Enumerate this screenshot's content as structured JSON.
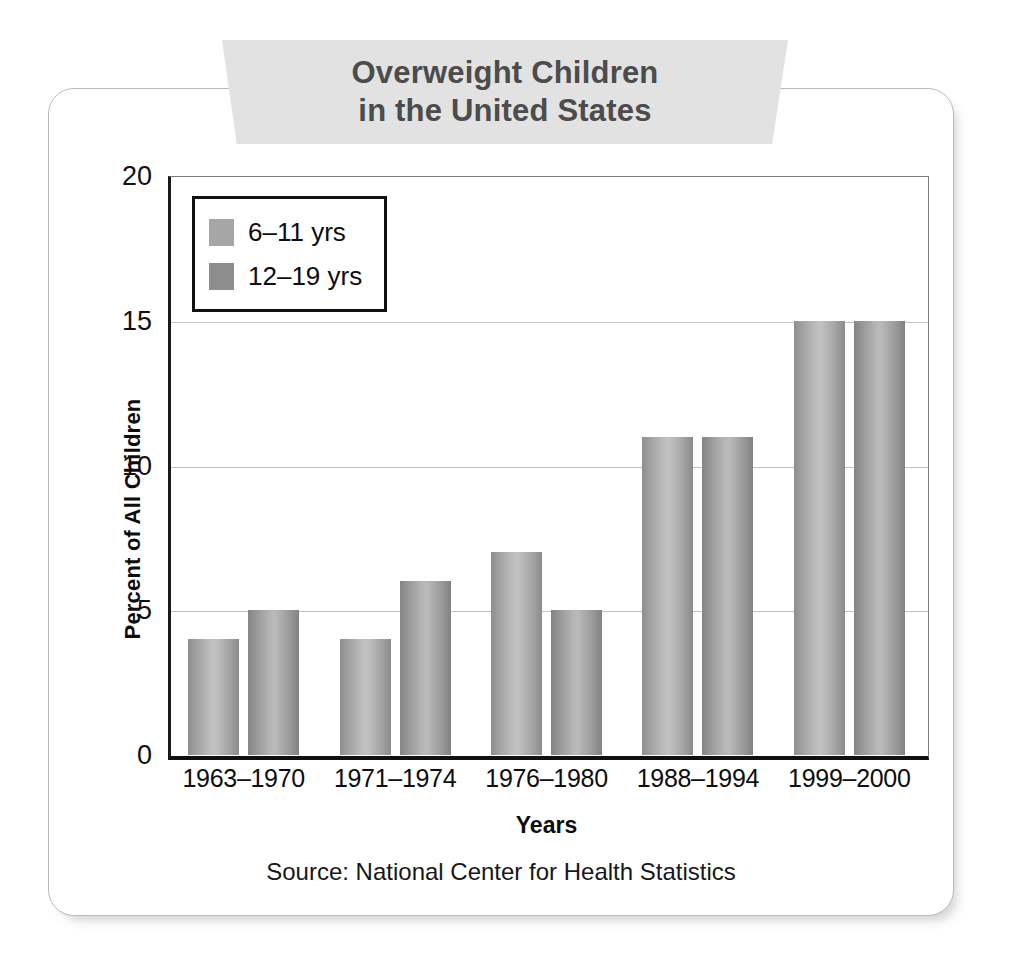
{
  "card": {
    "title_line1": "Overweight Children",
    "title_line2": "in the United States",
    "source": "Source: National Center for Health Statistics"
  },
  "colors": {
    "banner": "#e2e2e2",
    "title_text": "#4c4c4c",
    "series_6_11": "#a6a6a6",
    "series_12_19": "#8d8d8d",
    "axis": "#101010",
    "gridline": "#c3c3c3",
    "card_border": "#b9babc"
  },
  "chart_data": {
    "type": "bar",
    "title": "Overweight Children in the United States",
    "xlabel": "Years",
    "ylabel": "Percent of All Children",
    "ylim": [
      0,
      20
    ],
    "yticks": [
      0,
      5,
      10,
      15,
      20
    ],
    "grid": true,
    "legend_position": "top-left-inside",
    "categories": [
      "1963–1970",
      "1971–1974",
      "1976–1980",
      "1988–1994",
      "1999–2000"
    ],
    "series": [
      {
        "name": "6–11 yrs",
        "values": [
          4,
          4,
          7,
          11,
          15
        ]
      },
      {
        "name": "12–19 yrs",
        "values": [
          5,
          6,
          5,
          11,
          15
        ]
      }
    ],
    "annotations": [
      "Source: National Center for Health Statistics"
    ]
  }
}
